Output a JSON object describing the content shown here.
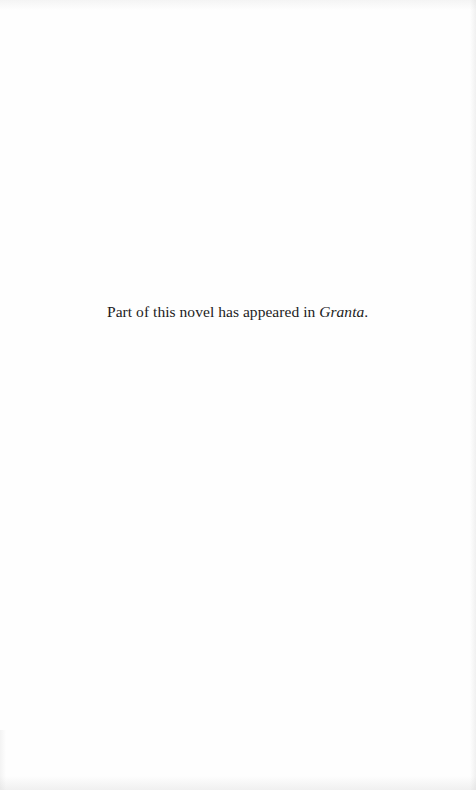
{
  "page": {
    "type": "copyright-notice-page",
    "background_color": "#fefefe",
    "text_color": "#1c1c1c"
  },
  "notice": {
    "text_before": "Part of this novel has appeared in ",
    "publication_title": "Granta",
    "text_after": "."
  }
}
